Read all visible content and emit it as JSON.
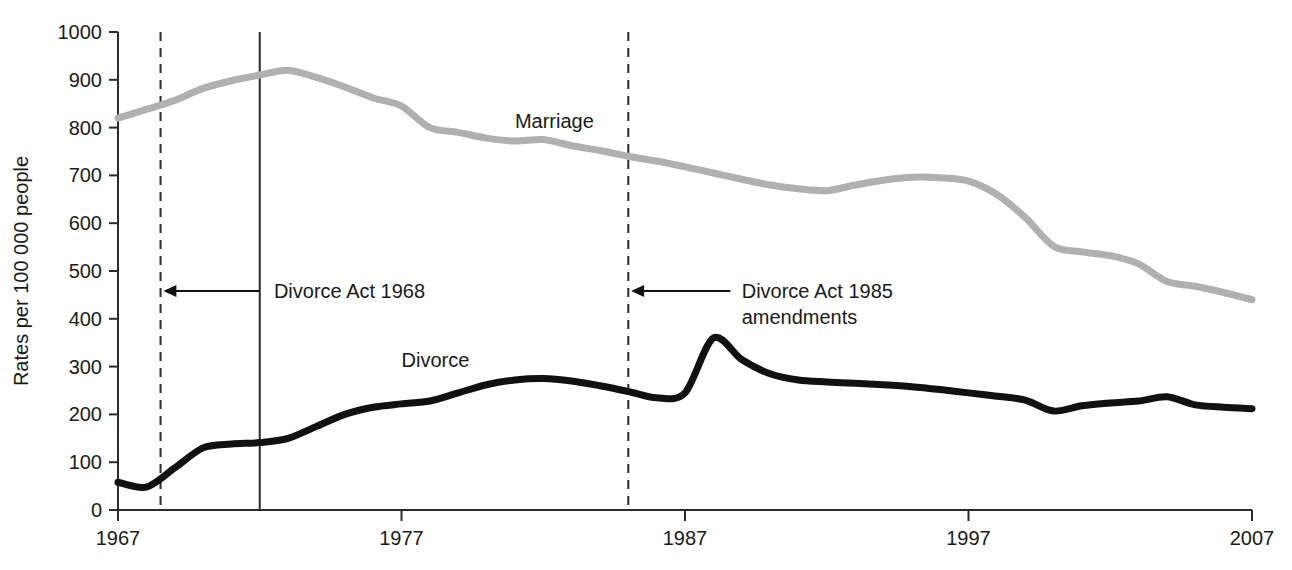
{
  "chart_data": {
    "type": "line",
    "title": "",
    "subtitle": "",
    "xlabel": "",
    "ylabel": "Rates per 100 000 people",
    "xlim": [
      1967,
      2007
    ],
    "ylim": [
      0,
      1000
    ],
    "grid": false,
    "legend_position": "inline-labels",
    "x_ticks": [
      "1967",
      "1977",
      "1987",
      "1997",
      "2007"
    ],
    "x_tick_values": [
      1967,
      1977,
      1987,
      1997,
      2007
    ],
    "y_ticks": [
      "0",
      "100",
      "200",
      "300",
      "400",
      "500",
      "600",
      "700",
      "800",
      "900",
      "1000"
    ],
    "y_tick_values": [
      0,
      100,
      200,
      300,
      400,
      500,
      600,
      700,
      800,
      900,
      1000
    ],
    "series": [
      {
        "name": "Marriage",
        "color": "#b0b0b0",
        "stroke_width": 7,
        "label_x": 1981,
        "label_y": 800,
        "x": [
          1967,
          1968,
          1969,
          1970,
          1971,
          1972,
          1973,
          1974,
          1975,
          1976,
          1977,
          1978,
          1979,
          1980,
          1981,
          1982,
          1983,
          1984,
          1985,
          1986,
          1987,
          1988,
          1989,
          1990,
          1991,
          1992,
          1993,
          1994,
          1995,
          1996,
          1997,
          1998,
          1999,
          2000,
          2001,
          2002,
          2003,
          2004,
          2005,
          2006,
          2007
        ],
        "values": [
          820,
          838,
          857,
          882,
          898,
          910,
          920,
          905,
          885,
          862,
          845,
          800,
          790,
          778,
          772,
          775,
          762,
          752,
          740,
          730,
          718,
          705,
          692,
          680,
          672,
          668,
          680,
          690,
          696,
          695,
          688,
          660,
          612,
          575,
          552,
          540,
          532,
          525,
          520,
          512,
          505
        ],
        "extra_tail": {
          "note": "post-2000 detail including spike",
          "x": [
            2000,
            2001,
            2002,
            2003,
            2004,
            2005,
            2006,
            2007
          ],
          "values": [
            552,
            540,
            532,
            515,
            478,
            468,
            455,
            440
          ]
        }
      },
      {
        "name": "Divorce",
        "color": "#111111",
        "stroke_width": 7,
        "label_x": 1977,
        "label_y": 300,
        "x": [
          1967,
          1968,
          1969,
          1970,
          1971,
          1972,
          1973,
          1974,
          1975,
          1976,
          1977,
          1978,
          1979,
          1980,
          1981,
          1982,
          1983,
          1984,
          1985,
          1986,
          1987,
          1988,
          1989,
          1990,
          1991,
          1992,
          1993,
          1994,
          1995,
          1996,
          1997,
          1998,
          1999,
          2000,
          2001,
          2002,
          2003,
          2004,
          2005,
          2006,
          2007
        ],
        "values": [
          58,
          48,
          88,
          130,
          138,
          141,
          150,
          175,
          200,
          215,
          222,
          228,
          245,
          262,
          272,
          275,
          270,
          260,
          248,
          235,
          245,
          360,
          315,
          285,
          272,
          268,
          265,
          262,
          258,
          252,
          245,
          238,
          230,
          207,
          218,
          224,
          228,
          237,
          220,
          215,
          212
        ]
      }
    ],
    "event_lines": [
      {
        "name": "divorce-act-1968-line",
        "x": 1968.5,
        "style": "dashed",
        "y_top": 1000,
        "y_bottom": 0
      },
      {
        "name": "marriage-peak-line",
        "x": 1972,
        "style": "solid",
        "y_top": 1000,
        "y_bottom": 0
      },
      {
        "name": "divorce-act-1985-line",
        "x": 1985.0,
        "style": "dashed",
        "y_top": 1000,
        "y_bottom": 0
      }
    ],
    "annotations": [
      {
        "id": "divorce-act-1968",
        "lines": [
          "Divorce Act 1968"
        ],
        "text_x": 1972.5,
        "text_y": 458,
        "arrow_from_x": 1972.0,
        "arrow_to_x": 1968.6,
        "arrow_y": 458
      },
      {
        "id": "divorce-act-1985",
        "lines": [
          "Divorce Act 1985",
          "amendments"
        ],
        "text_x": 1989.0,
        "text_y": 458,
        "arrow_from_x": 1988.6,
        "arrow_to_x": 1985.1,
        "arrow_y": 458
      }
    ]
  }
}
